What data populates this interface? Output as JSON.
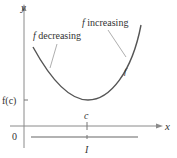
{
  "diagram": {
    "axes": {
      "x_label": "x",
      "y_label": "y",
      "origin_label": "0"
    },
    "curve": {
      "name": "f",
      "label": "f",
      "min_point_x_label": "c",
      "min_value_label": "f(c)"
    },
    "annotations": {
      "decreasing": "f decreasing",
      "decreasing_f": "f",
      "decreasing_text": " decreasing",
      "increasing_f": "f",
      "increasing_text": " increasing"
    },
    "interval": {
      "label": "I"
    },
    "colors": {
      "curve": "#555555",
      "axis": "#888888",
      "text": "#333333",
      "pointer": "#999999"
    }
  }
}
